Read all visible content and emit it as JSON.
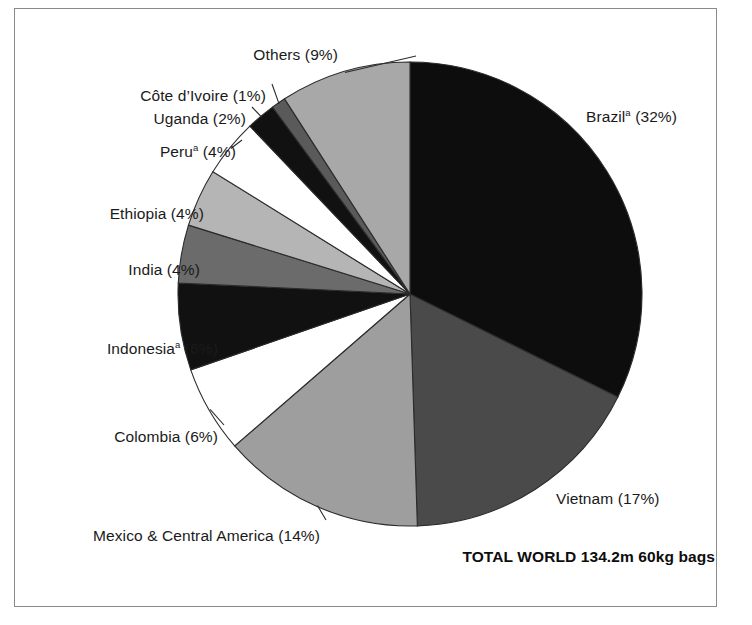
{
  "figure": {
    "background": "#ffffff",
    "frame_color": "#8a8a8a",
    "total_label": "TOTAL WORLD 134.2m 60kg bags"
  },
  "chart_data": {
    "type": "pie",
    "title": "",
    "subtitle": "",
    "xlabel": "",
    "ylabel": "",
    "units": "million 60kg bags",
    "total": "134.2m 60kg bags",
    "start_angle_deg": 0,
    "direction": "clockwise",
    "legend": "none",
    "labels_position": "outside-with-leader-lines",
    "categories": [
      "Brazil",
      "Vietnam",
      "Mexico & Central America",
      "Colombia",
      "Indonesia",
      "India",
      "Ethiopia",
      "Peru",
      "Uganda",
      "Côte d’Ivoire",
      "Others"
    ],
    "values": [
      32,
      17,
      14,
      6,
      6,
      4,
      4,
      4,
      2,
      1,
      9
    ],
    "slices": [
      {
        "name": "Brazil",
        "label_text": "Brazil",
        "footnote": "a",
        "value": 32,
        "percent_text": "(32%)",
        "full_label": "Brazilᵃ (32%)",
        "color": "#0d0d0d",
        "label_x": 586,
        "label_y": 108,
        "align": "right"
      },
      {
        "name": "Vietnam",
        "label_text": "Vietnam",
        "footnote": "",
        "value": 17,
        "percent_text": "(17%)",
        "full_label": "Vietnam (17%)",
        "color": "#4a4a4a",
        "label_x": 556,
        "label_y": 490,
        "align": "right"
      },
      {
        "name": "Mexico & Central America",
        "label_text": "Mexico & Central America",
        "footnote": "",
        "value": 14,
        "percent_text": "(14%)",
        "full_label": "Mexico & Central America (14%)",
        "color": "#9e9e9e",
        "label_x": 320,
        "label_y": 527,
        "align": "left"
      },
      {
        "name": "Colombia",
        "label_text": "Colombia",
        "footnote": "",
        "value": 6,
        "percent_text": "(6%)",
        "full_label": "Colombia (6%)",
        "color": "#ffffff",
        "label_x": 218,
        "label_y": 428,
        "align": "left"
      },
      {
        "name": "Indonesia",
        "label_text": "Indonesia",
        "footnote": "a",
        "value": 6,
        "percent_text": "(6%)",
        "full_label": "Indonesiaᵃ (6%)",
        "color": "#111111",
        "label_x": 218,
        "label_y": 340,
        "align": "left"
      },
      {
        "name": "India",
        "label_text": "India",
        "footnote": "",
        "value": 4,
        "percent_text": "(4%)",
        "full_label": "India (4%)",
        "color": "#6b6b6b",
        "label_x": 200,
        "label_y": 261,
        "align": "left"
      },
      {
        "name": "Ethiopia",
        "label_text": "Ethiopia",
        "footnote": "",
        "value": 4,
        "percent_text": "(4%)",
        "full_label": "Ethiopia (4%)",
        "color": "#b5b5b5",
        "label_x": 204,
        "label_y": 205,
        "align": "left"
      },
      {
        "name": "Peru",
        "label_text": "Peru",
        "footnote": "a",
        "value": 4,
        "percent_text": "(4%)",
        "full_label": "Peruᵃ (4%)",
        "color": "#ffffff",
        "label_x": 236,
        "label_y": 143,
        "align": "left"
      },
      {
        "name": "Uganda",
        "label_text": "Uganda",
        "footnote": "",
        "value": 2,
        "percent_text": "(2%)",
        "full_label": "Uganda (2%)",
        "color": "#111111",
        "label_x": 246,
        "label_y": 110,
        "align": "left"
      },
      {
        "name": "Côte d’Ivoire",
        "label_text": "Côte d’Ivoire",
        "footnote": "",
        "value": 1,
        "percent_text": "(1%)",
        "full_label": "Côte d’Ivoire (1%)",
        "color": "#5a5a5a",
        "label_x": 266,
        "label_y": 87,
        "align": "left"
      },
      {
        "name": "Others",
        "label_text": "Others",
        "footnote": "",
        "value": 9,
        "percent_text": "(9%)",
        "full_label": "Others (9%)",
        "color": "#a8a8a8",
        "label_x": 338,
        "label_y": 46,
        "align": "left"
      }
    ]
  }
}
